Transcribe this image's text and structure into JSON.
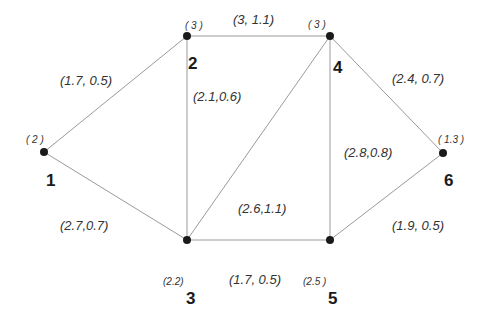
{
  "graph": {
    "nodes": [
      {
        "id": "1",
        "weight": "( 2 )"
      },
      {
        "id": "2",
        "weight": "( 3 )"
      },
      {
        "id": "3",
        "weight": "(2.2)"
      },
      {
        "id": "4",
        "weight": "( 3 )"
      },
      {
        "id": "5",
        "weight": "(2.5 )"
      },
      {
        "id": "6",
        "weight": "( 1.3 )"
      }
    ],
    "edges": [
      {
        "from": "1",
        "to": "2",
        "label": "(1.7, 0.5)"
      },
      {
        "from": "1",
        "to": "3",
        "label": "(2.7,0.7)"
      },
      {
        "from": "2",
        "to": "4",
        "label": "(3, 1.1)"
      },
      {
        "from": "2",
        "to": "3",
        "label": "(2.1,0.6)"
      },
      {
        "from": "3",
        "to": "4",
        "label": "(2.6,1.1)"
      },
      {
        "from": "4",
        "to": "5",
        "label": "(2.8,0.8)"
      },
      {
        "from": "4",
        "to": "6",
        "label": "(2.4, 0.7)"
      },
      {
        "from": "3",
        "to": "5",
        "label": "(1.7, 0.5)"
      },
      {
        "from": "5",
        "to": "6",
        "label": "(1.9, 0.5)"
      }
    ]
  }
}
